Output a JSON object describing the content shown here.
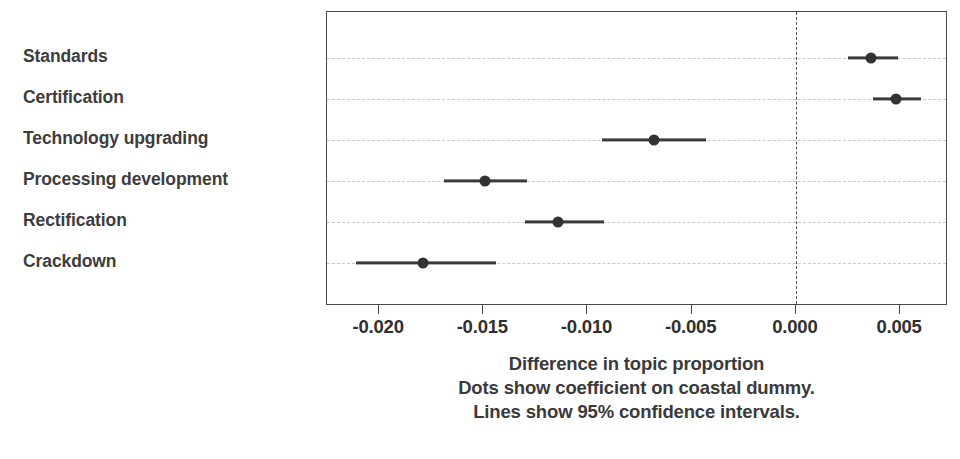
{
  "chart_data": {
    "type": "scatter",
    "orientation": "horizontal",
    "title": "",
    "xlabel": "Difference in topic proportion",
    "ylabel": "",
    "xlim": [
      -0.0225,
      0.0073
    ],
    "grid": true,
    "legend": null,
    "reference_line": 0.0,
    "xticks": [
      -0.02,
      -0.015,
      -0.01,
      -0.005,
      0.0,
      0.005
    ],
    "xticklabels": [
      "-0.020",
      "-0.015",
      "-0.010",
      "-0.005",
      "0.000",
      "0.005"
    ],
    "categories": [
      "Standards",
      "Certification",
      "Technology upgrading",
      "Processing development",
      "Rectification",
      "Crackdown"
    ],
    "values": [
      0.0036,
      0.0048,
      -0.0068,
      -0.0149,
      -0.0114,
      -0.0179
    ],
    "ci_low": [
      0.0025,
      0.0037,
      -0.0093,
      -0.0169,
      -0.013,
      -0.0211
    ],
    "ci_high": [
      0.0049,
      0.006,
      -0.0043,
      -0.0129,
      -0.0092,
      -0.0144
    ],
    "points": [
      {
        "label": "Standards",
        "value": 0.0036,
        "ci_low": 0.0025,
        "ci_high": 0.0049
      },
      {
        "label": "Certification",
        "value": 0.0048,
        "ci_low": 0.0037,
        "ci_high": 0.006
      },
      {
        "label": "Technology upgrading",
        "value": -0.0068,
        "ci_low": -0.0093,
        "ci_high": -0.0043
      },
      {
        "label": "Processing development",
        "value": -0.0149,
        "ci_low": -0.0169,
        "ci_high": -0.0129
      },
      {
        "label": "Rectification",
        "value": -0.0114,
        "ci_low": -0.013,
        "ci_high": -0.0092
      },
      {
        "label": "Crackdown",
        "value": -0.0179,
        "ci_low": -0.0211,
        "ci_high": -0.0144
      }
    ],
    "annotations": [
      "Difference in topic proportion",
      "Dots show coefficient on coastal dummy.",
      "Lines show 95% confidence intervals."
    ]
  },
  "axis": {
    "xlabel": "Difference in topic proportion",
    "ticks": [
      "-0.020",
      "-0.015",
      "-0.010",
      "-0.005",
      "0.000",
      "0.005"
    ]
  },
  "captions": {
    "line1": "Difference in topic proportion",
    "line2": "Dots show coefficient on coastal dummy.",
    "line3": "Lines show 95% confidence intervals."
  },
  "colors": {
    "marker": "#333333",
    "ci": "#3a3a3a",
    "grid": "#c9c9c9",
    "frame": "#4a4a4a",
    "zero_line": "#555555",
    "label_text": "#3d3d3d",
    "background": "#ffffff"
  }
}
